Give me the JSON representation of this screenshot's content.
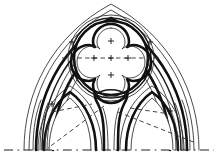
{
  "figure": {
    "style": "ink line drawing",
    "background_color": "#ffffff",
    "ink_color": "#111111",
    "construction_line_color": "#2f2f2f"
  },
  "canvas": {
    "width": 218,
    "height": 163,
    "baseline_y": 150,
    "apex": {
      "x": 111,
      "y": 6
    },
    "left_springer_x": 24,
    "right_springer_x": 199,
    "centre_mullion_x": 111
  },
  "elements": {
    "outer_arch_label": "outer pointed arch order",
    "moulding_bands_label": "concentric moulding bands",
    "quatrefoil_label": "quatrefoil oculus",
    "left_lancet_label": "left lancet light",
    "right_lancet_label": "right lancet light",
    "mullion_label": "central mullion",
    "baseline_label": "springing baseline",
    "construction_label": "dashed setting-out lines"
  },
  "quatrefoil": {
    "centre_x": 111,
    "centre_y": 58,
    "outer_radius": 40,
    "lobe_count": 4,
    "lobe_radius": 18,
    "cusp_count": 4
  },
  "lancets": [
    {
      "name": "left-lancet",
      "centre_x": 70,
      "apex_y": 92,
      "foot_y": 150,
      "half_width": 29
    },
    {
      "name": "right-lancet",
      "centre_x": 152,
      "apex_y": 92,
      "foot_y": 150,
      "half_width": 29
    }
  ],
  "construction_marks": {
    "centre_cross": {
      "x": 111,
      "y": 58
    },
    "lobe_centres": [
      {
        "x": 111,
        "y": 41,
        "label": "upper-lobe-centre"
      },
      {
        "x": 94,
        "y": 58,
        "label": "left-lobe-centre"
      },
      {
        "x": 128,
        "y": 58,
        "label": "right-lobe-centre"
      },
      {
        "x": 111,
        "y": 75,
        "label": "lower-lobe-centre"
      }
    ],
    "horizontal_axis": {
      "x1": 62,
      "x2": 160,
      "y": 58
    },
    "diagonals": [
      {
        "name": "left-diagonal",
        "x1": 104,
        "y1": 106,
        "x2": 48,
        "y2": 148
      },
      {
        "name": "right-diagonal",
        "x1": 118,
        "y1": 112,
        "x2": 196,
        "y2": 143
      },
      {
        "name": "left-lancet-chord",
        "x1": 52,
        "y1": 112,
        "x2": 92,
        "y2": 104
      },
      {
        "name": "right-lancet-chord",
        "x1": 130,
        "y1": 108,
        "x2": 170,
        "y2": 114
      }
    ],
    "baseline": {
      "x1": 4,
      "x2": 214,
      "y": 150
    }
  },
  "legend": {
    "solid_line": "masonry profile",
    "dashed_line": "construction geometry",
    "cross_marker": "compass centre point"
  }
}
